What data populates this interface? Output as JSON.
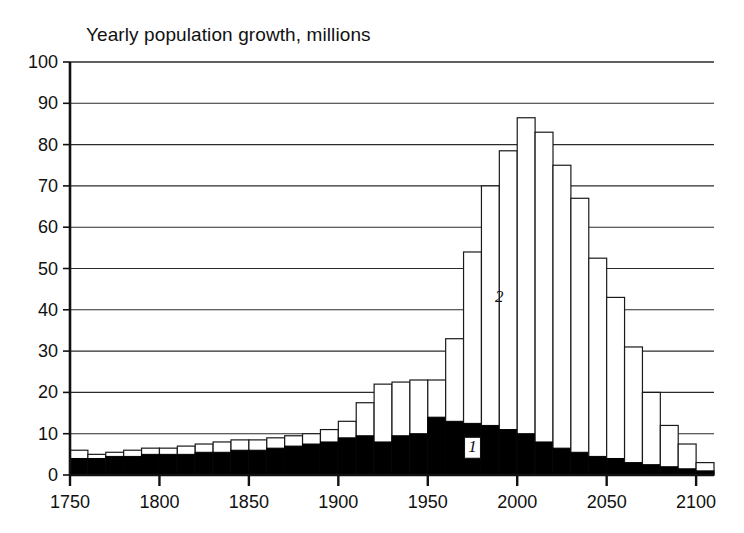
{
  "chart_data": {
    "type": "bar",
    "title": "Yearly population growth, millions",
    "xlabel": "",
    "ylabel": "",
    "stacked": true,
    "grid": true,
    "legend_position": "inline-annotation",
    "xlim": [
      1750,
      2110
    ],
    "ylim": [
      0,
      100
    ],
    "ytick_step": 10,
    "yticks": [
      "0",
      "10",
      "20",
      "30",
      "40",
      "50",
      "60",
      "70",
      "80",
      "90",
      "100"
    ],
    "xticks": [
      "1750",
      "1800",
      "1850",
      "1900",
      "1950",
      "2000",
      "2050",
      "2100"
    ],
    "bar_span_years": 10,
    "categories": [
      1750,
      1760,
      1770,
      1780,
      1790,
      1800,
      1810,
      1820,
      1830,
      1840,
      1850,
      1860,
      1870,
      1880,
      1890,
      1900,
      1910,
      1920,
      1930,
      1940,
      1950,
      1960,
      1970,
      1980,
      1990,
      2000,
      2010,
      2020,
      2030,
      2040,
      2050,
      2060,
      2070,
      2080,
      2090,
      2100
    ],
    "series": [
      {
        "name": "1",
        "label": "1",
        "color": "#000000",
        "description": "more developed / lower segment (solid black)",
        "values": [
          4.0,
          4.0,
          4.5,
          4.5,
          5.0,
          5.0,
          5.0,
          5.5,
          5.5,
          6.0,
          6.0,
          6.5,
          7.0,
          7.5,
          8.0,
          9.0,
          9.5,
          8.0,
          9.5,
          10.0,
          14.0,
          13.0,
          12.5,
          12.0,
          11.0,
          10.0,
          8.0,
          6.5,
          5.5,
          4.5,
          4.0,
          3.0,
          2.5,
          2.0,
          1.5,
          1.0
        ]
      },
      {
        "name": "2",
        "label": "2",
        "color": "#ffffff",
        "description": "less developed / upper segment (white)",
        "values": [
          2.0,
          1.0,
          1.0,
          1.5,
          1.5,
          1.5,
          2.0,
          2.0,
          2.5,
          2.5,
          2.5,
          2.5,
          2.5,
          2.5,
          3.0,
          4.0,
          8.0,
          14.0,
          13.0,
          13.0,
          9.0,
          20.0,
          41.5,
          58.0,
          67.5,
          76.5,
          75.0,
          68.5,
          61.5,
          48.0,
          39.0,
          28.0,
          17.5,
          10.0,
          6.0,
          2.0
        ]
      }
    ],
    "totals": [
      6.0,
      5.0,
      5.5,
      6.0,
      6.5,
      6.5,
      7.0,
      7.5,
      8.0,
      8.5,
      8.5,
      9.0,
      9.5,
      10.0,
      11.0,
      13.0,
      17.5,
      22.0,
      22.5,
      23.0,
      23.0,
      33.0,
      54.0,
      70.0,
      78.5,
      86.5,
      83.0,
      75.0,
      67.0,
      52.5,
      43.0,
      31.0,
      20.0,
      12.0,
      7.5,
      3.0
    ],
    "annotations": [
      {
        "text": "2",
        "at_year": 1990,
        "at_value": 42,
        "style": "italic"
      },
      {
        "text": "1",
        "at_year": 1975,
        "at_value": 5.5,
        "style": "italic",
        "boxed": true
      }
    ]
  }
}
